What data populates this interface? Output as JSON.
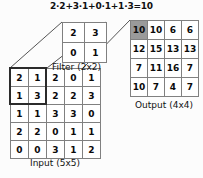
{
  "diagram": {
    "formula": "2·2+3·1+0·1+1·3=10",
    "input": {
      "label": "Input (5x5)",
      "rows": [
        [
          2,
          1,
          2,
          0,
          1
        ],
        [
          1,
          3,
          2,
          2,
          3
        ],
        [
          1,
          1,
          3,
          3,
          0
        ],
        [
          2,
          2,
          0,
          1,
          1
        ],
        [
          0,
          0,
          3,
          1,
          2
        ]
      ],
      "highlight": {
        "row": 0,
        "col": 0,
        "rows_span": 2,
        "cols_span": 2
      }
    },
    "filter": {
      "label": "Filter (2x2)",
      "rows": [
        [
          2,
          3
        ],
        [
          0,
          1
        ]
      ]
    },
    "output": {
      "label": "Output (4x4)",
      "rows": [
        [
          10,
          10,
          6,
          6
        ],
        [
          12,
          15,
          13,
          13
        ],
        [
          7,
          11,
          16,
          7
        ],
        [
          10,
          7,
          4,
          7
        ]
      ],
      "highlight": {
        "row": 0,
        "col": 0
      }
    },
    "colors": {
      "highlight_fill": "#9a9a9a",
      "cell_border": "#808080",
      "window_border": "#2b2b2b",
      "connector": "#555555",
      "text": "#0a0a0a",
      "background": "#fcfcfc"
    }
  }
}
